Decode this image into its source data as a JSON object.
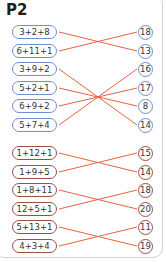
{
  "title": "P2",
  "colors": {
    "blue_border": "#6f8ed3",
    "red_border": "#9b4f43",
    "line": "#e8623f"
  },
  "groups": [
    {
      "color": "blue",
      "left": [
        {
          "expr": "3+2+8",
          "y": 32
        },
        {
          "expr": "6+11+1",
          "y": 51
        },
        {
          "expr": "3+9+2",
          "y": 69
        },
        {
          "expr": "5+2+1",
          "y": 88
        },
        {
          "expr": "6+9+2",
          "y": 106
        },
        {
          "expr": "5+7+4",
          "y": 125
        }
      ],
      "right": [
        {
          "value": "18",
          "y": 32
        },
        {
          "value": "13",
          "y": 51
        },
        {
          "value": "16",
          "y": 69
        },
        {
          "value": "17",
          "y": 88
        },
        {
          "value": "8",
          "y": 106
        },
        {
          "value": "14",
          "y": 125
        }
      ],
      "connections": [
        [
          0,
          1
        ],
        [
          1,
          0
        ],
        [
          2,
          5
        ],
        [
          3,
          4
        ],
        [
          4,
          3
        ],
        [
          5,
          2
        ]
      ]
    },
    {
      "color": "red",
      "left": [
        {
          "expr": "1+12+1",
          "y": 153
        },
        {
          "expr": "1+9+5",
          "y": 172
        },
        {
          "expr": "1+8+11",
          "y": 190
        },
        {
          "expr": "12+5+1",
          "y": 209
        },
        {
          "expr": "5+13+1",
          "y": 227
        },
        {
          "expr": "4+3+4",
          "y": 246
        }
      ],
      "right": [
        {
          "value": "15",
          "y": 153
        },
        {
          "value": "14",
          "y": 172
        },
        {
          "value": "18",
          "y": 190
        },
        {
          "value": "20",
          "y": 209
        },
        {
          "value": "11",
          "y": 227
        },
        {
          "value": "19",
          "y": 246
        }
      ],
      "connections": [
        [
          0,
          1
        ],
        [
          1,
          0
        ],
        [
          2,
          3
        ],
        [
          3,
          2
        ],
        [
          4,
          5
        ],
        [
          5,
          4
        ]
      ]
    }
  ]
}
